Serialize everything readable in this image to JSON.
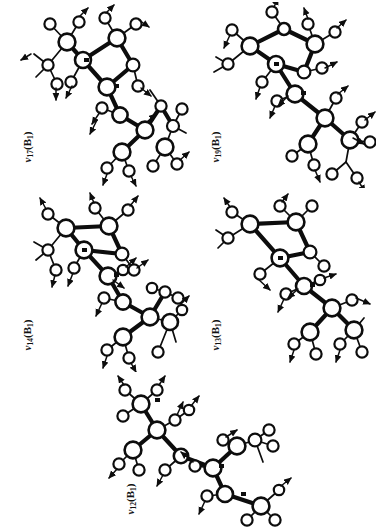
{
  "figure": {
    "kind": "molecular-vibrational-mode-diagrams",
    "background_color": "#ffffff",
    "ink_color": "#0d0d0d",
    "orientation_note": "page rotated 90 degrees; all mode labels read bottom-to-top",
    "panel_count": 5,
    "symmetry_species": "B1"
  },
  "panels": [
    {
      "id": "panel-nu17",
      "mode_symbol": "ν",
      "mode_index": "17",
      "symmetry": "B",
      "symmetry_index": "1",
      "label_text": "ν17(B1)",
      "grid_position": "top-left",
      "atom_count": 14,
      "arrow_count": 13
    },
    {
      "id": "panel-nu19",
      "mode_symbol": "ν",
      "mode_index": "19",
      "symmetry": "B",
      "symmetry_index": "1",
      "label_text": "ν19(B1)",
      "grid_position": "top-right",
      "atom_count": 14,
      "arrow_count": 13
    },
    {
      "id": "panel-nu14",
      "mode_symbol": "ν",
      "mode_index": "14",
      "symmetry": "B",
      "symmetry_index": "1",
      "label_text": "ν14(B1)",
      "grid_position": "middle-left",
      "atom_count": 14,
      "arrow_count": 12
    },
    {
      "id": "panel-nu13",
      "mode_symbol": "ν",
      "mode_index": "13",
      "symmetry": "B",
      "symmetry_index": "1",
      "label_text": "ν13(B1)",
      "grid_position": "middle-right",
      "atom_count": 14,
      "arrow_count": 9
    },
    {
      "id": "panel-nu12",
      "mode_symbol": "ν",
      "mode_index": "12",
      "symmetry": "B",
      "symmetry_index": "1",
      "label_text": "ν12(B1)",
      "grid_position": "bottom-center",
      "atom_count": 14,
      "arrow_count": 10
    }
  ]
}
